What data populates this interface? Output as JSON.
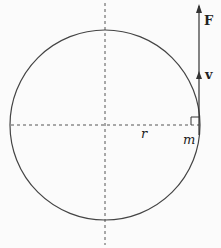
{
  "diagram": {
    "type": "circular-motion-force-diagram",
    "labels": {
      "force": "F",
      "velocity": "v",
      "radius": "r",
      "mass": "m"
    },
    "colors": {
      "stroke": "#333333",
      "dashed": "#555555",
      "background": "#fbfbfb"
    }
  }
}
